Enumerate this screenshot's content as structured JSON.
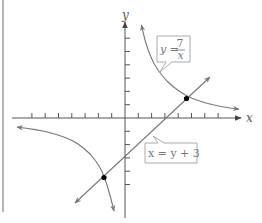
{
  "diagram": {
    "type": "coordinate-graph",
    "axes": {
      "x_label": "x",
      "y_label": "y",
      "origin_px": [
        125,
        118
      ],
      "unit_px": 13.3,
      "x_ticks": [
        -8,
        -7,
        -6,
        -5,
        -4,
        -3,
        -2,
        -1,
        1,
        2,
        3,
        4,
        5,
        6,
        7,
        8
      ],
      "y_ticks": [
        -5,
        -4,
        -3,
        -2,
        -1,
        1,
        2,
        3,
        4,
        5,
        6
      ]
    },
    "curves": [
      {
        "name": "hyperbola",
        "equation": "y = 7/x",
        "label_lhs": "y =",
        "label_num": "7",
        "label_den": "x"
      },
      {
        "name": "line",
        "equation": "x = y + 3",
        "label": "x = y + 3"
      }
    ],
    "intersections": [
      {
        "x": 4.54,
        "y": 1.54
      },
      {
        "x": -1.54,
        "y": -4.54
      }
    ],
    "colors": {
      "axis": "#555555",
      "curve": "#777777",
      "frame": "#999999",
      "point": "#000000"
    }
  }
}
